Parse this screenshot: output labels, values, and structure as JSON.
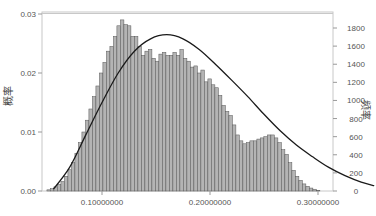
{
  "chart_data": {
    "type": "bar",
    "subtype": "histogram_with_density_curve",
    "title": "",
    "xlabel": "",
    "ylabel_left": "概率",
    "ylabel_right": "频率",
    "x_ticks": [
      "0.10000000",
      "0.20000000",
      "0.30000000"
    ],
    "x_tick_values": [
      0.1,
      0.2,
      0.3
    ],
    "y_left_ticks": [
      "0.00",
      "0.01",
      "0.02",
      "0.03"
    ],
    "y_left_tick_values": [
      0.0,
      0.01,
      0.02,
      0.03
    ],
    "y_right_ticks": [
      "0",
      "200",
      "400",
      "600",
      "800",
      "1000",
      "1200",
      "1400",
      "1600",
      "1800"
    ],
    "y_right_tick_values": [
      0,
      200,
      400,
      600,
      800,
      1000,
      1200,
      1400,
      1600,
      1800
    ],
    "ylim_left": [
      0,
      0.03
    ],
    "ylim_right": [
      0,
      1800
    ],
    "xlim": [
      0.035,
      0.37
    ],
    "grid": false,
    "legend": null,
    "bin_start": 0.049,
    "bin_width": 0.00324,
    "bar_color": "#b4b4b4",
    "bar_edge_color": "#555555",
    "curve_color": "#1a1a1a",
    "values": [
      0.0002,
      0.0004,
      0.0007,
      0.0011,
      0.0016,
      0.0025,
      0.0036,
      0.0048,
      0.0064,
      0.0082,
      0.01,
      0.012,
      0.0139,
      0.016,
      0.0178,
      0.02,
      0.0218,
      0.0237,
      0.0245,
      0.0262,
      0.028,
      0.029,
      0.0282,
      0.028,
      0.0262,
      0.0262,
      0.0245,
      0.023,
      0.0237,
      0.024,
      0.0225,
      0.022,
      0.0232,
      0.0235,
      0.023,
      0.023,
      0.0235,
      0.023,
      0.024,
      0.0225,
      0.022,
      0.021,
      0.0212,
      0.02,
      0.0205,
      0.0185,
      0.019,
      0.018,
      0.0175,
      0.0162,
      0.0145,
      0.0135,
      0.0128,
      0.0112,
      0.0095,
      0.0085,
      0.008,
      0.0082,
      0.0085,
      0.0085,
      0.0088,
      0.009,
      0.0092,
      0.0095,
      0.0095,
      0.009,
      0.0082,
      0.007,
      0.0062,
      0.0048,
      0.0035,
      0.0025,
      0.0018,
      0.0012,
      0.0008,
      0.0005,
      0.0003,
      0.0001
    ],
    "density_curve": {
      "x": [
        0.055,
        0.07,
        0.085,
        0.1,
        0.115,
        0.13,
        0.145,
        0.16,
        0.175,
        0.19,
        0.205,
        0.22,
        0.235,
        0.25,
        0.265,
        0.28,
        0.295,
        0.31,
        0.325,
        0.34,
        0.352
      ],
      "y": [
        0.0003,
        0.004,
        0.0095,
        0.015,
        0.02,
        0.0237,
        0.0258,
        0.0265,
        0.0258,
        0.024,
        0.0215,
        0.0188,
        0.016,
        0.013,
        0.0102,
        0.0078,
        0.0058,
        0.004,
        0.0026,
        0.0015,
        0.0009
      ]
    }
  }
}
